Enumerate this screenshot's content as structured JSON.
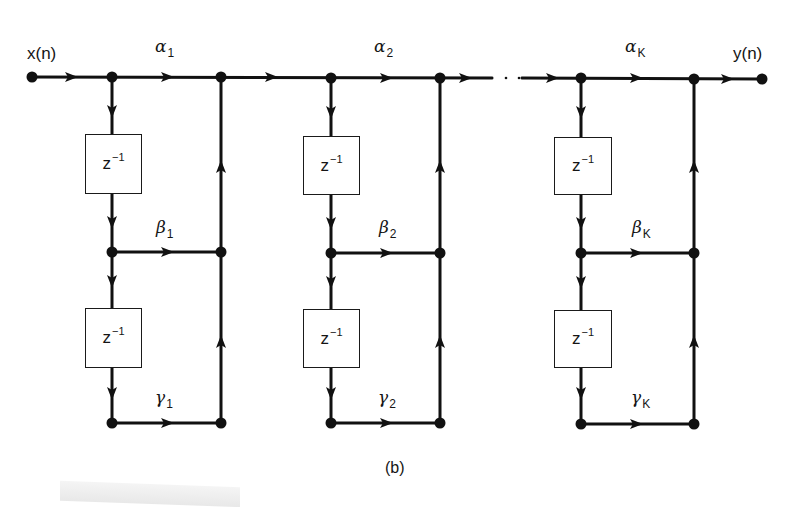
{
  "figure": {
    "caption": "(b)",
    "input_label": "x(n)",
    "output_label": "y(n)",
    "ellipsis": ". . .",
    "delay_label": "z",
    "delay_exponent": "−1"
  },
  "stages": [
    {
      "alpha": "α",
      "alpha_sub": "1",
      "beta": "β",
      "beta_sub": "1",
      "gamma": "γ",
      "gamma_sub": "1",
      "left_x": 112,
      "right_x": 221,
      "box_left": 85,
      "box_right": 141
    },
    {
      "alpha": "α",
      "alpha_sub": "2",
      "beta": "β",
      "beta_sub": "2",
      "gamma": "γ",
      "gamma_sub": "2",
      "left_x": 331,
      "right_x": 440,
      "box_left": 303,
      "box_right": 359
    },
    {
      "alpha": "α",
      "alpha_sub": "K",
      "beta": "β",
      "beta_sub": "K",
      "gamma": "γ",
      "gamma_sub": "K",
      "left_x": 581,
      "right_x": 694,
      "box_left": 554,
      "box_right": 611
    }
  ],
  "colors": {
    "line": "#111111",
    "background": "#ffffff"
  }
}
